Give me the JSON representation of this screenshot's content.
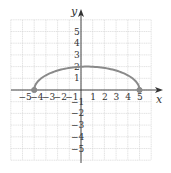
{
  "chart_data": {
    "type": "line",
    "title": "",
    "xlabel": "x",
    "ylabel": "y",
    "xlim": [
      -6,
      6
    ],
    "ylim": [
      -6,
      6
    ],
    "grid": true,
    "legend": null,
    "x_ticks": [
      -5,
      -4,
      -3,
      -2,
      -1,
      1,
      2,
      3,
      4,
      5
    ],
    "y_ticks": [
      -5,
      -4,
      -3,
      -2,
      -1,
      1,
      2,
      3,
      4,
      5
    ],
    "x_tick_labels": [
      "−5",
      "−4",
      "−3",
      "−2",
      "−1",
      "1",
      "2",
      "3",
      "4",
      "5"
    ],
    "y_tick_labels": [
      "−5",
      "−4",
      "−3",
      "−2",
      "−1",
      "1",
      "2",
      "3",
      "4",
      "5"
    ],
    "series": [
      {
        "name": "upper semi-ellipse",
        "shape": "semi-ellipse",
        "center": [
          0.5,
          0
        ],
        "semi_axis_x": 4.5,
        "semi_axis_y": 2,
        "x": [
          -4,
          -3,
          -2,
          -1,
          0,
          0.5,
          1,
          2,
          3,
          4,
          5
        ],
        "y": [
          0,
          1.25,
          1.66,
          1.89,
          1.99,
          2,
          1.99,
          1.89,
          1.66,
          1.25,
          0
        ],
        "endpoints": [
          [
            -4,
            0
          ],
          [
            5,
            0
          ]
        ],
        "endpoint_style": "closed",
        "color": "#8a8a8a"
      }
    ]
  },
  "style": {
    "curve_color": "#8a8a8a",
    "axis_color": "#333333",
    "grid_color": "#d0d0d0"
  }
}
